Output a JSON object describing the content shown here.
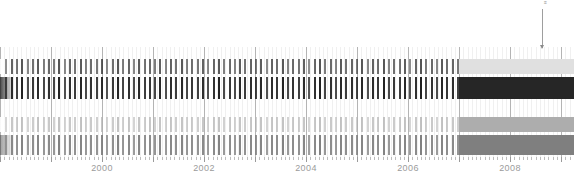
{
  "chart_data": {
    "type": "bar",
    "title": "",
    "subtitle": "",
    "xlabel": "",
    "ylabel": "",
    "grid": true,
    "legend_position": "none",
    "xlim": [
      1998.0,
      2009.25
    ],
    "x_tick_labels": [
      "2000",
      "2002",
      "2004",
      "2006",
      "2008"
    ],
    "x_tick_values": [
      2000,
      2002,
      2004,
      2006,
      2008
    ],
    "x_minor_tick_interval": 0.0833,
    "series": [
      {
        "name": "band-1",
        "row": 0,
        "color": "#303030",
        "y_top": 59,
        "height": 15,
        "solid_fill_color": "#e0e0e0",
        "solid_fill_start": 2007.0,
        "values": [
          0.55,
          0.3,
          0.62,
          0.48,
          0.7,
          0.35,
          0.52,
          0.66,
          0.4,
          0.58,
          0.44,
          0.72,
          0.33,
          0.6,
          0.5,
          0.68,
          0.38,
          0.56,
          0.46,
          0.64,
          0.31,
          0.54,
          0.71,
          0.42,
          0.59,
          0.36,
          0.67,
          0.49,
          0.57,
          0.43,
          0.65,
          0.34,
          0.61,
          0.51,
          0.69,
          0.39,
          0.53,
          0.47,
          0.63,
          0.32,
          0.58,
          0.7,
          0.41,
          0.55,
          0.37,
          0.66,
          0.5,
          0.6,
          0.45,
          0.68,
          0.33,
          0.62,
          0.52,
          0.71,
          0.38,
          0.56,
          0.48,
          0.64,
          0.3,
          0.59,
          0.72,
          0.43,
          0.57,
          0.35,
          0.67,
          0.51,
          0.61,
          0.44,
          0.69,
          0.34,
          0.63,
          0.53,
          0.7,
          0.39,
          0.54,
          0.49,
          0.65,
          0.31,
          0.6,
          0.73,
          0.42,
          0.58,
          0.36,
          0.68,
          0.52,
          0.62,
          0.46,
          0.7,
          0.33,
          0.64,
          0.54,
          0.71,
          0.4,
          0.55,
          0.5,
          0.66,
          0.32,
          0.61,
          0.74,
          0.44,
          0.59,
          0.37,
          0.69,
          0.53,
          0.63,
          0.47,
          0.71,
          0.35
        ]
      },
      {
        "name": "band-2",
        "row": 1,
        "color": "#1c1c1c",
        "y_top": 77,
        "height": 22,
        "solid_fill_color": "#262626",
        "solid_fill_start": 2007.0,
        "values": [
          0.8,
          0.62,
          0.88,
          0.74,
          0.95,
          0.66,
          0.82,
          0.9,
          0.7,
          0.85,
          0.72,
          0.96,
          0.64,
          0.87,
          0.78,
          0.92,
          0.68,
          0.84,
          0.75,
          0.89,
          0.61,
          0.81,
          0.94,
          0.71,
          0.86,
          0.67,
          0.91,
          0.77,
          0.83,
          0.73,
          0.9,
          0.65,
          0.88,
          0.79,
          0.93,
          0.69,
          0.8,
          0.76,
          0.87,
          0.63,
          0.85,
          0.95,
          0.7,
          0.82,
          0.68,
          0.9,
          0.78,
          0.86,
          0.74,
          0.92,
          0.64,
          0.88,
          0.8,
          0.96,
          0.69,
          0.83,
          0.76,
          0.89,
          0.62,
          0.86,
          0.97,
          0.72,
          0.84,
          0.66,
          0.91,
          0.79,
          0.87,
          0.73,
          0.93,
          0.65,
          0.89,
          0.81,
          0.95,
          0.7,
          0.82,
          0.77,
          0.9,
          0.63,
          0.86,
          0.98,
          0.71,
          0.85,
          0.67,
          0.92,
          0.8,
          0.88,
          0.75,
          0.94,
          0.64,
          0.9,
          0.82,
          0.96,
          0.69,
          0.83,
          0.78,
          0.91,
          0.62,
          0.87,
          0.99,
          0.73,
          0.85,
          0.68,
          0.93,
          0.81,
          0.89,
          0.76,
          0.95,
          0.66
        ]
      },
      {
        "name": "band-3",
        "row": 2,
        "color": "#b0b0b0",
        "y_top": 117,
        "height": 15,
        "solid_fill_color": "#adadad",
        "solid_fill_start": 2007.0,
        "values": [
          0.48,
          0.26,
          0.55,
          0.41,
          0.62,
          0.3,
          0.46,
          0.58,
          0.35,
          0.51,
          0.38,
          0.64,
          0.28,
          0.53,
          0.44,
          0.6,
          0.33,
          0.49,
          0.4,
          0.57,
          0.27,
          0.47,
          0.63,
          0.36,
          0.52,
          0.31,
          0.59,
          0.43,
          0.5,
          0.37,
          0.58,
          0.29,
          0.54,
          0.45,
          0.61,
          0.34,
          0.46,
          0.41,
          0.56,
          0.28,
          0.51,
          0.62,
          0.35,
          0.48,
          0.32,
          0.59,
          0.44,
          0.53,
          0.39,
          0.6,
          0.29,
          0.55,
          0.46,
          0.63,
          0.33,
          0.49,
          0.42,
          0.57,
          0.26,
          0.52,
          0.64,
          0.37,
          0.5,
          0.3,
          0.59,
          0.45,
          0.54,
          0.38,
          0.61,
          0.29,
          0.56,
          0.47,
          0.62,
          0.34,
          0.47,
          0.43,
          0.58,
          0.27,
          0.53,
          0.65,
          0.36,
          0.51,
          0.31,
          0.6,
          0.46,
          0.55,
          0.4,
          0.62,
          0.28,
          0.57,
          0.48,
          0.63,
          0.35,
          0.48,
          0.44,
          0.59,
          0.27,
          0.54,
          0.66,
          0.38,
          0.52,
          0.32,
          0.61,
          0.47,
          0.56,
          0.41,
          0.63,
          0.3
        ]
      },
      {
        "name": "band-4",
        "row": 3,
        "color": "#7d7d7d",
        "y_top": 135,
        "height": 20,
        "solid_fill_color": "#7f7f7f",
        "solid_fill_start": 2007.0,
        "values": [
          0.78,
          0.6,
          0.86,
          0.72,
          0.93,
          0.64,
          0.8,
          0.88,
          0.68,
          0.83,
          0.7,
          0.94,
          0.62,
          0.85,
          0.76,
          0.9,
          0.66,
          0.82,
          0.73,
          0.87,
          0.59,
          0.79,
          0.92,
          0.69,
          0.84,
          0.65,
          0.89,
          0.75,
          0.81,
          0.71,
          0.88,
          0.63,
          0.86,
          0.77,
          0.91,
          0.67,
          0.78,
          0.74,
          0.85,
          0.61,
          0.83,
          0.93,
          0.68,
          0.8,
          0.66,
          0.88,
          0.76,
          0.84,
          0.72,
          0.9,
          0.62,
          0.86,
          0.78,
          0.94,
          0.67,
          0.81,
          0.74,
          0.87,
          0.6,
          0.84,
          0.95,
          0.7,
          0.82,
          0.64,
          0.89,
          0.77,
          0.85,
          0.71,
          0.91,
          0.63,
          0.87,
          0.79,
          0.93,
          0.68,
          0.8,
          0.75,
          0.88,
          0.61,
          0.84,
          0.96,
          0.69,
          0.83,
          0.65,
          0.9,
          0.78,
          0.86,
          0.73,
          0.92,
          0.62,
          0.88,
          0.8,
          0.94,
          0.67,
          0.81,
          0.76,
          0.89,
          0.6,
          0.85,
          0.97,
          0.71,
          0.83,
          0.66,
          0.91,
          0.79,
          0.87,
          0.74,
          0.93,
          0.64
        ]
      }
    ],
    "annotations": [
      {
        "name": "event-marker",
        "label": "≡",
        "x_value": 2008.35,
        "x_px": 542,
        "line_top": 9,
        "line_bottom": 48
      }
    ]
  },
  "axis": {
    "labels": [
      "2000",
      "2002",
      "2004",
      "2006",
      "2008"
    ],
    "label_color": "#9b9b9b"
  },
  "colors": {
    "background": "#ffffff",
    "gridline": "#d9d9d9",
    "gridline_major": "#b4b4b4",
    "band1": "#303030",
    "band2": "#1c1c1c",
    "band3": "#b0b0b0",
    "band4": "#7d7d7d",
    "axis_text": "#9b9b9b",
    "annotation": "#9e9e9e"
  }
}
